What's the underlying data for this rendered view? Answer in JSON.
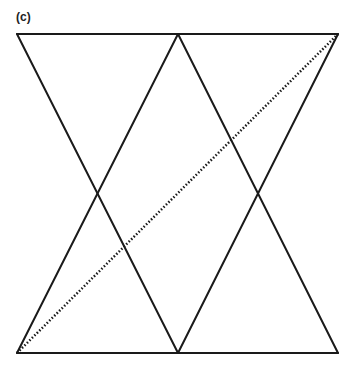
{
  "figure": {
    "panel_label": "(c)",
    "stroke_color": "#1a1a1a",
    "frame": {
      "left": 17,
      "right": 338,
      "top": 34,
      "bottom": 353,
      "mid_x": 178
    },
    "solid_lines": [
      {
        "x1": 17,
        "y1": 34,
        "x2": 338,
        "y2": 34
      },
      {
        "x1": 17,
        "y1": 353,
        "x2": 338,
        "y2": 353
      },
      {
        "x1": 17,
        "y1": 34,
        "x2": 178,
        "y2": 353
      },
      {
        "x1": 178,
        "y1": 34,
        "x2": 17,
        "y2": 353
      },
      {
        "x1": 178,
        "y1": 34,
        "x2": 338,
        "y2": 353
      },
      {
        "x1": 338,
        "y1": 34,
        "x2": 178,
        "y2": 353
      }
    ],
    "dotted_line": {
      "x1": 17,
      "y1": 353,
      "x2": 338,
      "y2": 34
    }
  }
}
